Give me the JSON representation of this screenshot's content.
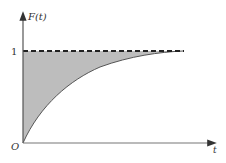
{
  "figure": {
    "y_axis_label": "F(t)",
    "x_axis_label": "t",
    "origin_label": "O",
    "asymptote_tick_label": "1",
    "function": "F(t) = 1 - e^(-kt)",
    "asymptote": 1,
    "shaded_region": "between curve and asymptote F=1",
    "colors": {
      "axis": "#444444",
      "curve": "#555555",
      "shade": "#bbbbbb",
      "dashed_line": "#222222"
    }
  }
}
